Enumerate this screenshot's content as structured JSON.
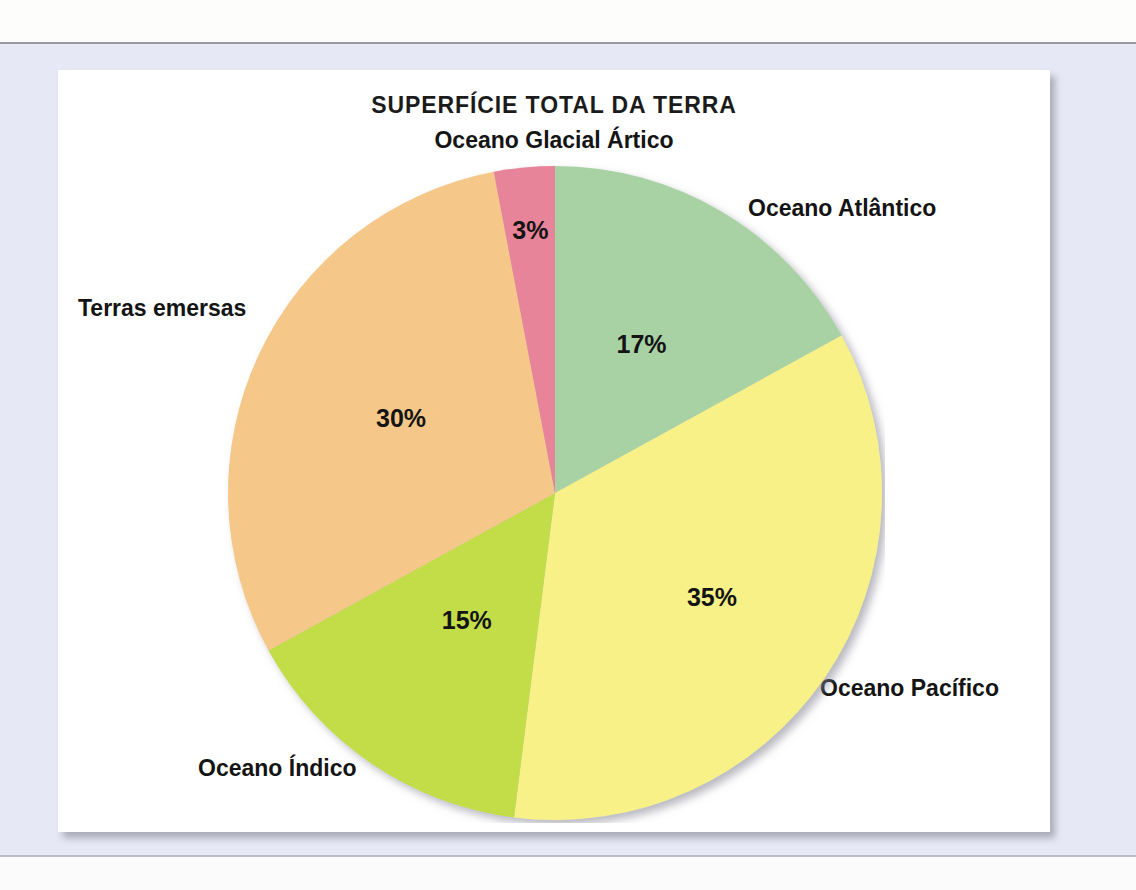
{
  "chart_data": {
    "type": "pie",
    "title": "SUPERFÍCIE TOTAL DA TERRA",
    "categories": [
      "Oceano Atlântico",
      "Oceano Pacífico",
      "Oceano Índico",
      "Terras emersas",
      "Oceano Glacial Ártico"
    ],
    "values": [
      17,
      35,
      15,
      30,
      3
    ],
    "value_labels": [
      "17%",
      "35%",
      "15%",
      "30%",
      "3%"
    ],
    "colors": [
      "#a9d2a4",
      "#f7f188",
      "#c3dd4a",
      "#f5c88a",
      "#e8849a"
    ],
    "units": "percent",
    "start_angle_deg": 0,
    "direction": "clockwise",
    "legend": "none",
    "labels_position": "outside-callout",
    "grid": false,
    "xlabel": "",
    "ylabel": ""
  },
  "card": {
    "title": "SUPERFÍCIE TOTAL DA TERRA"
  },
  "labels": {
    "arctic": "Oceano Glacial Ártico",
    "atlantic": "Oceano Atlântico",
    "lands": "Terras emersas",
    "indian": "Oceano Índico",
    "pacific": "Oceano Pacífico"
  },
  "percents": {
    "arctic": "3%",
    "atlantic": "17%",
    "pacific": "35%",
    "indian": "15%",
    "lands": "30%"
  },
  "palette": {
    "atlantic": "#a9d2a4",
    "pacific": "#f7f188",
    "indian": "#c3dd4a",
    "lands": "#f5c88a",
    "arctic": "#e8849a",
    "page_background": "#e6e9f5",
    "card_background": "#ffffff",
    "text": "#141414"
  }
}
